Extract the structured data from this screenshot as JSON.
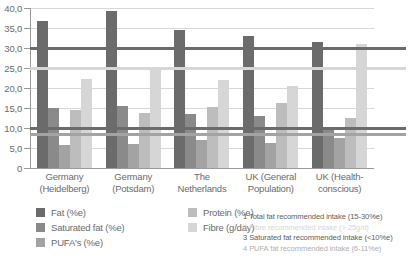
{
  "chart_data": {
    "type": "bar",
    "title": "",
    "xlabel": "",
    "ylabel": "",
    "ylim": [
      0,
      40
    ],
    "grid": true,
    "legend_position": "bottom-left",
    "ytick_labels": [
      "40,0",
      "35,0",
      "30,0",
      "25,0",
      "20,0",
      "15,0",
      "10,0",
      "5,0",
      "0"
    ],
    "ytick_values": [
      40,
      35,
      30,
      25,
      20,
      15,
      10,
      5,
      0
    ],
    "categories": [
      "Germany\n(Heidelberg)",
      "Germany\n(Potsdam)",
      "The\nNetherlands",
      "UK (General\nPopulation)",
      "UK (Health-\nconscious)"
    ],
    "category_lines": [
      [
        "Germany",
        "(Heidelberg)"
      ],
      [
        "Germany",
        "(Potsdam)"
      ],
      [
        "The",
        "Netherlands"
      ],
      [
        "UK (General",
        "Population)"
      ],
      [
        "UK (Health-",
        "conscious)"
      ]
    ],
    "series": [
      {
        "name": "Fat (%e)",
        "color": "#6b6b6b",
        "values": [
          36.8,
          39.2,
          34.6,
          33.0,
          31.5
        ]
      },
      {
        "name": "Saturated fat (%e)",
        "color": "#8a8a8a",
        "values": [
          15.0,
          15.5,
          13.4,
          13.0,
          9.7
        ]
      },
      {
        "name": "PUFA's (%e)",
        "color": "#a3a3a3",
        "values": [
          5.8,
          6.0,
          7.0,
          6.3,
          7.4
        ]
      },
      {
        "name": "Protein (%e)",
        "color": "#bdbdbd",
        "values": [
          14.6,
          13.8,
          15.2,
          16.3,
          12.5
        ]
      },
      {
        "name": "Fibre (g/day)",
        "color": "#d6d6d6",
        "values": [
          22.3,
          24.7,
          22.0,
          20.5,
          31.0
        ]
      }
    ],
    "reference_lines": [
      {
        "label": "1",
        "value": 30.0,
        "color": "#6b6b6b"
      },
      {
        "label": "2",
        "value": 25.0,
        "color": "#d6d6d6"
      },
      {
        "label": "3",
        "value": 10.0,
        "color": "#6b6b6b"
      },
      {
        "label": "4",
        "value": 8.5,
        "color": "#a3a3a3"
      }
    ],
    "annotations": [
      {
        "label": "1",
        "text": "1 Total fat recommended intake (15-30%e)",
        "color": "#5d5d5d"
      },
      {
        "label": "2",
        "text": "2 Fibre recommended intake (> 25g/d)",
        "color": "#d6d6d6"
      },
      {
        "label": "3",
        "text": "3 Saturated fat recommended intake (<10%e)",
        "color": "#5d5d5d"
      },
      {
        "label": "4",
        "text": "4 PUFA fat recommended intake (6-11%e)",
        "color": "#b0b0b0"
      }
    ]
  },
  "legend": {
    "column_1": [
      "Fat (%e)",
      "Saturated fat (%e)",
      "PUFA's (%e)"
    ],
    "column_2": [
      "Protein (%e)",
      "Fibre (g/day)"
    ]
  }
}
